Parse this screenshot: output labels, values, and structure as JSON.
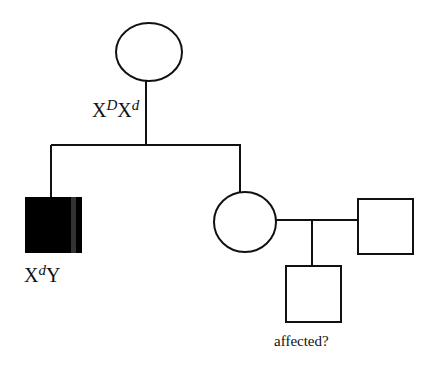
{
  "diagram": {
    "type": "pedigree",
    "individuals": [
      {
        "id": "mother",
        "sex": "female",
        "affected": false,
        "genotype": {
          "base1": "X",
          "sup1": "D",
          "base2": "X",
          "sup2": "d"
        }
      },
      {
        "id": "son",
        "sex": "male",
        "affected": true,
        "genotype": {
          "base1": "X",
          "sup1": "d",
          "base2": "Y"
        }
      },
      {
        "id": "daughter",
        "sex": "female",
        "affected": false
      },
      {
        "id": "daughter-mate",
        "sex": "male",
        "affected": false
      },
      {
        "id": "grandson",
        "sex": "male",
        "affected": null,
        "note": "affected?"
      }
    ],
    "colors": {
      "line": "#111111",
      "affected_fill": "#000000",
      "unaffected_fill": "#ffffff"
    }
  }
}
